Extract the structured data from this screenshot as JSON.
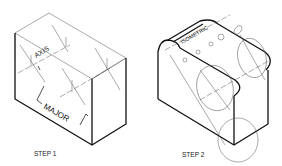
{
  "figure": {
    "step1": {
      "caption": "STEP 1",
      "label_axis": "AXIS",
      "label_major": "MAJOR"
    },
    "step2": {
      "caption": "STEP 2",
      "label_isometric": "ISOMETRIC"
    }
  }
}
